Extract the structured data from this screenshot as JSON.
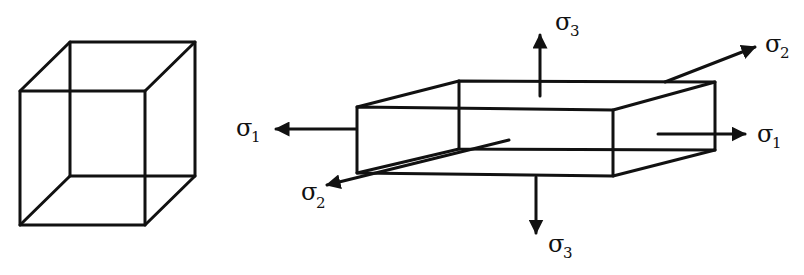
{
  "diagram": {
    "cube": {
      "label": "unstressed-cube"
    },
    "box": {
      "label": "stressed-box"
    },
    "stresses": [
      {
        "id": "sigma1-left",
        "symbol": "σ",
        "subscript": "1"
      },
      {
        "id": "sigma1-right",
        "symbol": "σ",
        "subscript": "1"
      },
      {
        "id": "sigma2-top",
        "symbol": "σ",
        "subscript": "2"
      },
      {
        "id": "sigma2-bottom",
        "symbol": "σ",
        "subscript": "2"
      },
      {
        "id": "sigma3-top",
        "symbol": "σ",
        "subscript": "3"
      },
      {
        "id": "sigma3-bottom",
        "symbol": "σ",
        "subscript": "3"
      }
    ],
    "colors": {
      "line": "#111111",
      "background": "#ffffff"
    }
  }
}
